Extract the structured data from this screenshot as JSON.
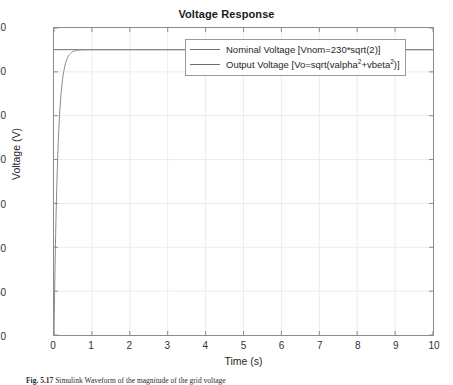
{
  "figure": {
    "caption_label": "Fig. 5.17",
    "caption_text": "Simulink Waveform of the magnitude of the grid voltage"
  },
  "chart_data": {
    "type": "line",
    "title": "Voltage Response",
    "xlabel": "Time (s)",
    "ylabel": "Voltage (V)",
    "xlim": [
      0,
      10
    ],
    "ylim": [
      0,
      350
    ],
    "xticks": [
      0,
      1,
      2,
      3,
      4,
      5,
      6,
      7,
      8,
      9,
      10
    ],
    "yticks": [
      0,
      50,
      100,
      150,
      200,
      250,
      300,
      350
    ],
    "grid": true,
    "legend_position": "top-center",
    "steady_state_value": 325.27,
    "series": [
      {
        "name": "Nominal Voltage [Vnom=230*sqrt(2)]",
        "label_base": "Nominal Voltage [Vnom=230*sqrt(2)]",
        "color": "#6e6e6e",
        "type": "constant",
        "value": 325.27,
        "x": [
          0,
          10
        ],
        "values": [
          325.27,
          325.27
        ]
      },
      {
        "name": "Output Voltage [Vo=sqrt(valpha^2+vbeta^2)]",
        "label_prefix": "Output Voltage [Vo=sqrt(valpha",
        "label_exp1": "2",
        "label_mid": "+vbeta",
        "label_exp2": "2",
        "label_suffix": ")]",
        "color": "#8a8a8a",
        "type": "step-response",
        "time_constant": 0.1,
        "x": [
          0,
          0.05,
          0.1,
          0.15,
          0.2,
          0.25,
          0.3,
          0.35,
          0.4,
          0.5,
          0.6,
          0.7,
          0.8,
          1.0,
          1.5,
          2,
          3,
          4,
          5,
          6,
          7,
          8,
          9,
          10
        ],
        "values": [
          0,
          128.0,
          205.5,
          252.5,
          281.0,
          298.2,
          308.6,
          315.0,
          318.8,
          323.1,
          324.4,
          324.9,
          325.1,
          325.25,
          325.27,
          325.27,
          325.27,
          325.27,
          325.27,
          325.27,
          325.27,
          325.27,
          325.27,
          325.27
        ]
      }
    ]
  }
}
